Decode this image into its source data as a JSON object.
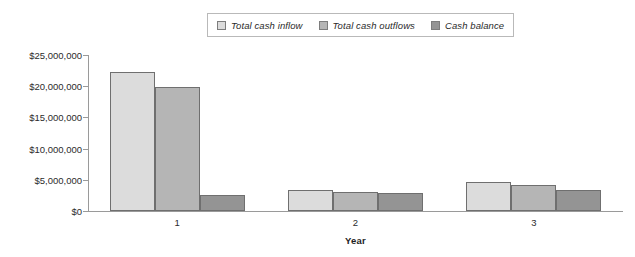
{
  "chart_data": {
    "type": "bar",
    "title": "",
    "subtitle": "",
    "xlabel": "Year",
    "ylabel": "",
    "categories": [
      "1",
      "2",
      "3"
    ],
    "series": [
      {
        "name": "Total cash inflow",
        "color": "#dcdcdc",
        "values": [
          22300000,
          3400000,
          4600000
        ]
      },
      {
        "name": "Total cash outflows",
        "color": "#b5b5b5",
        "values": [
          19800000,
          3100000,
          4200000
        ]
      },
      {
        "name": "Cash balance",
        "color": "#949494",
        "values": [
          2500000,
          2900000,
          3400000
        ]
      }
    ],
    "ylim": [
      0,
      25000000
    ],
    "ytick_values": [
      0,
      5000000,
      10000000,
      15000000,
      20000000,
      25000000
    ],
    "ytick_labels": [
      "$0",
      "$5,000,000",
      "$10,000,000",
      "$15,000,000",
      "$20,000,000",
      "$25,000,000"
    ],
    "grid": false,
    "legend_position": "top-center",
    "bar_border_color": "#6f6f6f",
    "axis_color": "#9a9a9a",
    "background": "#ffffff"
  },
  "legend": {
    "entries": [
      {
        "label": "Total cash inflow"
      },
      {
        "label": "Total cash outflows"
      },
      {
        "label": "Cash balance"
      }
    ]
  },
  "axes": {
    "x_title": "Year",
    "x_tick_labels": [
      "1",
      "2",
      "3"
    ],
    "y_tick_labels": [
      "$25,000,000",
      "$20,000,000",
      "$15,000,000",
      "$10,000,000",
      "$5,000,000",
      "$0"
    ]
  }
}
